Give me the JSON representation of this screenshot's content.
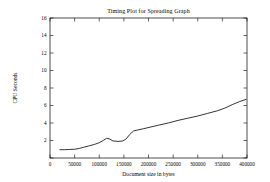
{
  "chart_data": {
    "type": "line",
    "title": "Timing Plot for Spreading Graph",
    "xlabel": "Document size in bytes",
    "ylabel": "CPU Seconds",
    "xlim": [
      0,
      400000
    ],
    "ylim": [
      0,
      16
    ],
    "grid": false,
    "legend": null,
    "xticks": [
      0,
      50000,
      100000,
      150000,
      200000,
      250000,
      300000,
      350000,
      400000
    ],
    "xtick_labels": [
      "0",
      "50000",
      "100000",
      "150000",
      "200000",
      "250000",
      "300000",
      "350000",
      "400000"
    ],
    "yticks": [
      0,
      2,
      4,
      6,
      8,
      10,
      12,
      14,
      16
    ],
    "ytick_labels": [
      "",
      "2",
      "4",
      "6",
      "8",
      "10",
      "12",
      "14",
      "16"
    ],
    "series": [
      {
        "name": "Spreading Graph timing",
        "x": [
          20000,
          30000,
          40000,
          50000,
          60000,
          70000,
          80000,
          90000,
          100000,
          108000,
          115000,
          120000,
          128000,
          138000,
          148000,
          155000,
          162000,
          170000,
          178000,
          190000,
          205000,
          220000,
          240000,
          260000,
          280000,
          300000,
          320000,
          340000,
          355000,
          370000,
          385000,
          398000
        ],
        "y": [
          0.95,
          0.95,
          0.98,
          1.0,
          1.1,
          1.25,
          1.4,
          1.55,
          1.75,
          2.0,
          2.25,
          2.2,
          1.95,
          1.9,
          1.95,
          2.2,
          2.7,
          3.1,
          3.2,
          3.35,
          3.55,
          3.75,
          4.0,
          4.3,
          4.55,
          4.8,
          5.1,
          5.4,
          5.7,
          6.1,
          6.45,
          6.7
        ]
      }
    ]
  },
  "figure": {
    "plot_area": {
      "left": 50,
      "top": 18,
      "right": 247,
      "bottom": 158
    }
  }
}
